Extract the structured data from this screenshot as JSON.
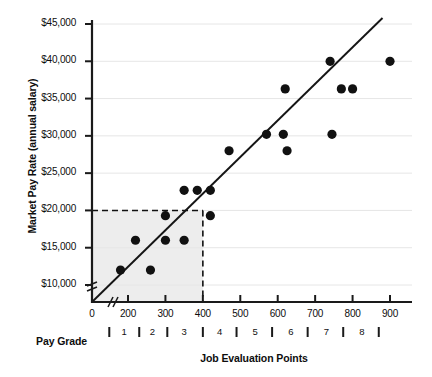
{
  "chart_data": {
    "type": "scatter",
    "title": "",
    "xlabel": "Job Evaluation Points",
    "ylabel": "Market Pay Rate (annual salary)",
    "secondary_xlabel": "Pay Grade",
    "xlim": [
      0,
      950
    ],
    "ylim": [
      0,
      45000
    ],
    "x_axis_break": true,
    "y_axis_break": true,
    "grid": "horizontal",
    "legend": "none",
    "x_ticks": [
      {
        "value": 0,
        "label": "0"
      },
      {
        "value": 200,
        "label": "200"
      },
      {
        "value": 300,
        "label": "300"
      },
      {
        "value": 400,
        "label": "400"
      },
      {
        "value": 500,
        "label": "500"
      },
      {
        "value": 600,
        "label": "600"
      },
      {
        "value": 700,
        "label": "700"
      },
      {
        "value": 800,
        "label": "800"
      },
      {
        "value": 900,
        "label": "900"
      }
    ],
    "y_ticks": [
      {
        "value": 10000,
        "label": "$10,000"
      },
      {
        "value": 15000,
        "label": "$15,000"
      },
      {
        "value": 20000,
        "label": "$20,000"
      },
      {
        "value": 25000,
        "label": "$25,000"
      },
      {
        "value": 30000,
        "label": "$30,000"
      },
      {
        "value": 35000,
        "label": "$35,000"
      },
      {
        "value": 40000,
        "label": "$40,000"
      },
      {
        "value": 45000,
        "label": "$45,000"
      }
    ],
    "pay_grades": [
      {
        "label": "1",
        "center": 190
      },
      {
        "label": "2",
        "center": 265
      },
      {
        "label": "3",
        "center": 350
      },
      {
        "label": "4",
        "center": 445
      },
      {
        "label": "5",
        "center": 540
      },
      {
        "label": "6",
        "center": 635
      },
      {
        "label": "7",
        "center": 730
      },
      {
        "label": "8",
        "center": 825
      }
    ],
    "pay_grade_boundaries": [
      150,
      230,
      305,
      400,
      490,
      585,
      680,
      775,
      870
    ],
    "series": [
      {
        "name": "Market pay data",
        "marker": "filled-circle",
        "color": "#111111",
        "points": [
          {
            "x": 180,
            "y": 12000
          },
          {
            "x": 220,
            "y": 16000
          },
          {
            "x": 260,
            "y": 12000
          },
          {
            "x": 300,
            "y": 16000
          },
          {
            "x": 300,
            "y": 19300
          },
          {
            "x": 350,
            "y": 16000
          },
          {
            "x": 350,
            "y": 22700
          },
          {
            "x": 385,
            "y": 22700
          },
          {
            "x": 420,
            "y": 22700
          },
          {
            "x": 420,
            "y": 19300
          },
          {
            "x": 470,
            "y": 28000
          },
          {
            "x": 570,
            "y": 30200
          },
          {
            "x": 615,
            "y": 30200
          },
          {
            "x": 620,
            "y": 36300
          },
          {
            "x": 625,
            "y": 28000
          },
          {
            "x": 740,
            "y": 40000
          },
          {
            "x": 745,
            "y": 30200
          },
          {
            "x": 770,
            "y": 36300
          },
          {
            "x": 800,
            "y": 36300
          },
          {
            "x": 900,
            "y": 40000
          }
        ]
      }
    ],
    "trend_line": {
      "name": "market pay line",
      "color": "#111111",
      "from": {
        "x": 0,
        "y": 0
      },
      "to": {
        "x": 880,
        "y": 45800
      }
    },
    "annotations": [
      {
        "name": "pay-policy-box",
        "type": "shaded-rectangle",
        "x_from": 0,
        "x_to": 400,
        "y_from": 0,
        "y_to": 20000,
        "fill": "#ededed"
      },
      {
        "name": "dashed-guide-horizontal",
        "type": "dashed-line",
        "value": 20000,
        "from_x": 0,
        "to_x": 400
      },
      {
        "name": "dashed-guide-vertical",
        "type": "dashed-line",
        "value": 400,
        "from_y": 0,
        "to_y": 20000
      }
    ],
    "colors": {
      "marker": "#111111",
      "axis": "#1a1a1a",
      "gridline": "#e3e3e3",
      "shaded_region": "#ededed",
      "text": "#0d0d0d"
    }
  }
}
